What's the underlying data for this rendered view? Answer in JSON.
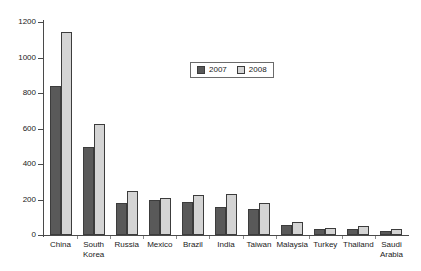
{
  "chart_data": {
    "type": "bar",
    "title": "",
    "subtitle": "",
    "xlabel": "",
    "ylabel": "",
    "ylim": [
      0,
      1200
    ],
    "yticks": [
      0,
      200,
      400,
      600,
      800,
      1000,
      1200
    ],
    "ytick_labels": [
      "0",
      "200",
      "400",
      "600",
      "800",
      "1000",
      "1200"
    ],
    "grid": false,
    "legend_position": "upper-center",
    "categories": [
      "China",
      "South\nKorea",
      "Russia",
      "Mexico",
      "Brazil",
      "India",
      "Taiwan",
      "Malaysia",
      "Turkey",
      "Thailand",
      "Saudi\nArabia"
    ],
    "series": [
      {
        "name": "2007",
        "color": "#595959",
        "values": [
          840,
          495,
          180,
          195,
          185,
          160,
          145,
          55,
          35,
          35,
          22
        ]
      },
      {
        "name": "2008",
        "color": "#d4d4d4",
        "values": [
          1145,
          625,
          250,
          210,
          225,
          230,
          180,
          75,
          38,
          50,
          35
        ]
      }
    ]
  },
  "legend": {
    "items": [
      {
        "label": "2007",
        "color": "#595959"
      },
      {
        "label": "2008",
        "color": "#d4d4d4"
      }
    ]
  },
  "colors": {
    "series_2007": "#595959",
    "series_2008": "#d4d4d4",
    "bar_outline": "#3c3c3c",
    "axis": "#4a4a4a",
    "text": "#1a1a1a",
    "background": "#ffffff"
  }
}
